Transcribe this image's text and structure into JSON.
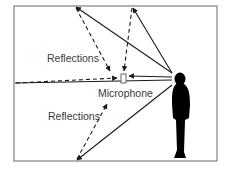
{
  "diagram": {
    "type": "acoustic-reflection-diagram",
    "labels": {
      "reflections_top": "Reflections",
      "reflections_bottom": "Reflections",
      "microphone": "Microphone"
    },
    "colors": {
      "frame": "#8a8a8a",
      "line": "#1a1a1a",
      "text": "#3a3a3a",
      "person": "#000000",
      "background": "#ffffff"
    },
    "elements": {
      "frame": {
        "x": 14,
        "y": 6,
        "width": 203,
        "height": 155
      },
      "source": {
        "name": "person-speaker",
        "head": [
          172,
          77
        ]
      },
      "microphone": {
        "x": 121,
        "y": 74,
        "width": 5,
        "height": 9
      },
      "reflection_points": [
        {
          "name": "ceiling-left",
          "x": 75,
          "y": 6
        },
        {
          "name": "ceiling-right",
          "x": 132,
          "y": 6
        },
        {
          "name": "back-wall",
          "x": 14,
          "y": 83
        },
        {
          "name": "floor",
          "x": 76,
          "y": 161
        }
      ],
      "paths": [
        {
          "kind": "direct",
          "from": [
            172,
            77
          ],
          "to": [
            128,
            76
          ]
        },
        {
          "kind": "incident",
          "from": [
            172,
            73
          ],
          "to": [
            75,
            6
          ]
        },
        {
          "kind": "incident",
          "from": [
            172,
            73
          ],
          "to": [
            132,
            6
          ]
        },
        {
          "kind": "incident",
          "from": [
            172,
            80
          ],
          "to": [
            14,
            83
          ]
        },
        {
          "kind": "incident",
          "from": [
            172,
            85
          ],
          "to": [
            76,
            161
          ]
        },
        {
          "kind": "reflected",
          "from": [
            75,
            6
          ],
          "to": [
            110,
            72
          ]
        },
        {
          "kind": "reflected",
          "from": [
            132,
            6
          ],
          "to": [
            124,
            72
          ]
        },
        {
          "kind": "reflected",
          "from": [
            14,
            83
          ],
          "to": [
            118,
            78
          ]
        },
        {
          "kind": "reflected",
          "from": [
            76,
            161
          ],
          "to": [
            107,
            104
          ]
        }
      ]
    }
  }
}
